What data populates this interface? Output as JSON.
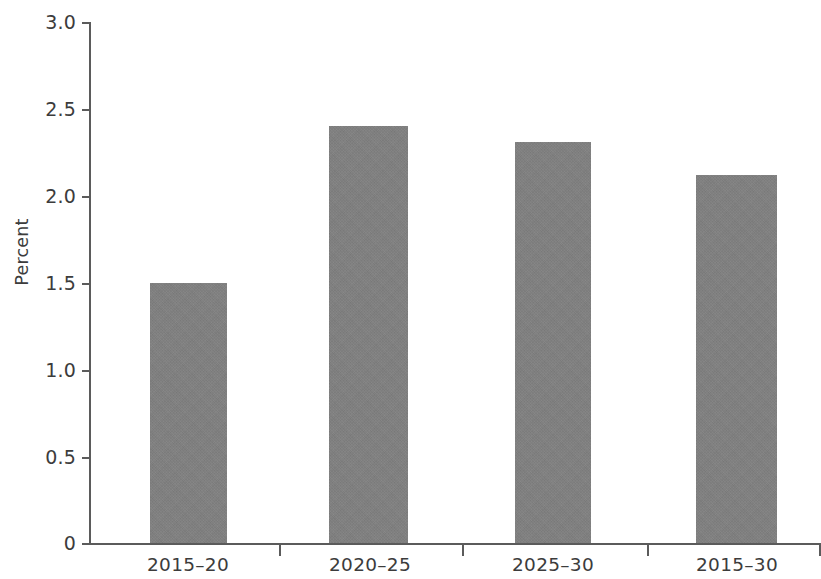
{
  "chart_data": {
    "type": "bar",
    "title": "",
    "subtitle": "",
    "xlabel": "",
    "ylabel": "Percent",
    "categories": [
      "2015–20",
      "2020–25",
      "2025–30",
      "2015–30"
    ],
    "values": [
      1.5,
      2.4,
      2.31,
      2.12
    ],
    "ylim": [
      0,
      3.0
    ],
    "ytick_labels": [
      "0",
      "0.5",
      "1.0",
      "1.5",
      "2.0",
      "2.5",
      "3.0"
    ],
    "ytick_values": [
      0,
      0.5,
      1.0,
      1.5,
      2.0,
      2.5,
      3.0
    ],
    "grid": false,
    "legend": null,
    "bar_color": "#808080",
    "axis_color": "#5b5b5b",
    "background_color": "#ffffff",
    "series": [
      {
        "name": "Percent",
        "values": [
          1.5,
          2.4,
          2.31,
          2.12
        ]
      }
    ]
  },
  "axis": {
    "y_title": "Percent",
    "y_ticks": [
      {
        "label": "3.0",
        "value": 3.0
      },
      {
        "label": "2.5",
        "value": 2.5
      },
      {
        "label": "2.0",
        "value": 2.0
      },
      {
        "label": "1.5",
        "value": 1.5
      },
      {
        "label": "1.0",
        "value": 1.0
      },
      {
        "label": "0.5",
        "value": 0.5
      },
      {
        "label": "0",
        "value": 0.0
      }
    ],
    "x_ticks": [
      {
        "label": "2015–20"
      },
      {
        "label": "2020–25"
      },
      {
        "label": "2025–30"
      },
      {
        "label": "2015–30"
      }
    ]
  },
  "bars": [
    {
      "category": "2015–20",
      "value": 1.5
    },
    {
      "category": "2020–25",
      "value": 2.4
    },
    {
      "category": "2025–30",
      "value": 2.31
    },
    {
      "category": "2015–30",
      "value": 2.12
    }
  ]
}
